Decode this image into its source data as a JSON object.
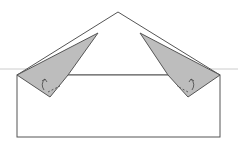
{
  "diagram": {
    "colors": {
      "paper": "#ffffff",
      "flap": "#bdbdbd",
      "outline": "#555555",
      "guide": "#cccccc",
      "arrow": "#444444"
    },
    "guide_line_y": 69,
    "rectangle": {
      "x": 17,
      "y": 75,
      "w": 203,
      "h": 62
    },
    "triangle": {
      "points": "17,75 118,12 220,75"
    },
    "left_flap": {
      "points": "17,75 98,33 68,75 50,97"
    },
    "right_flap": {
      "points": "140,33 220,75 188,97 168,75"
    },
    "left_arrow": {
      "path": "M44,90 Q40,84 45,79 M42,81 L45,79 L47,82"
    },
    "right_arrow": {
      "path": "M192,90 Q196,84 191,79 M189,82 L191,79 L194,81"
    },
    "left_fold_dash": {
      "path": "M48,92 L60,86"
    },
    "right_fold_dash": {
      "path": "M188,92 L177,86"
    }
  }
}
